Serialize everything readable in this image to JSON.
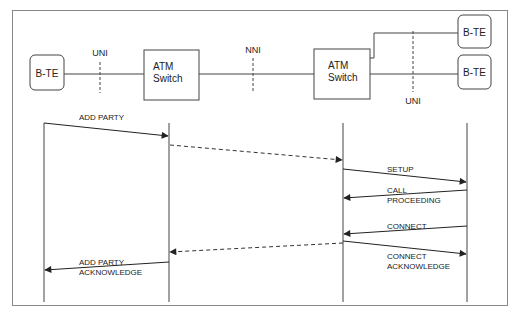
{
  "topology": {
    "nodes": [
      {
        "id": "bte-left",
        "label": "B-TE"
      },
      {
        "id": "atm-switch-1",
        "label_line1": "ATM",
        "label_line2": "Switch"
      },
      {
        "id": "atm-switch-2",
        "label_line1": "ATM",
        "label_line2": "Switch"
      },
      {
        "id": "bte-right-top",
        "label": "B-TE"
      },
      {
        "id": "bte-right-bottom",
        "label": "B-TE"
      }
    ],
    "interfaces": [
      {
        "id": "uni-left",
        "label": "UNI"
      },
      {
        "id": "nni",
        "label": "NNI"
      },
      {
        "id": "uni-right",
        "label": "UNI"
      }
    ]
  },
  "sequence": {
    "messages": [
      {
        "id": "add-party",
        "line1": "ADD PARTY",
        "line2": "",
        "from": "bte-left",
        "to": "atm-switch-1",
        "style": "solid"
      },
      {
        "id": "forward-1",
        "line1": "",
        "line2": "",
        "from": "atm-switch-1",
        "to": "atm-switch-2",
        "style": "dashed"
      },
      {
        "id": "setup",
        "line1": "SETUP",
        "line2": "",
        "from": "atm-switch-2",
        "to": "bte-right",
        "style": "solid"
      },
      {
        "id": "call-proceeding",
        "line1": "CALL",
        "line2": "PROCEEDING",
        "from": "bte-right",
        "to": "atm-switch-2",
        "style": "solid"
      },
      {
        "id": "connect",
        "line1": "CONNECT",
        "line2": "",
        "from": "bte-right",
        "to": "atm-switch-2",
        "style": "solid"
      },
      {
        "id": "connect-ack",
        "line1": "CONNECT",
        "line2": "ACKNOWLEDGE",
        "from": "atm-switch-2",
        "to": "bte-right",
        "style": "solid"
      },
      {
        "id": "backward-1",
        "line1": "",
        "line2": "",
        "from": "atm-switch-2",
        "to": "atm-switch-1",
        "style": "dashed"
      },
      {
        "id": "add-party-ack",
        "line1": "ADD PARTY",
        "line2": "ACKNOWLEDGE",
        "from": "atm-switch-1",
        "to": "bte-left",
        "style": "solid"
      }
    ]
  },
  "colors": {
    "stroke": "#333333",
    "frame": "#777777",
    "background": "#ffffff"
  }
}
